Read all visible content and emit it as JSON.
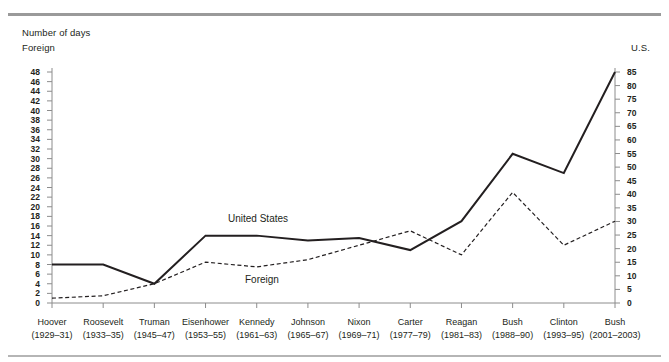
{
  "rules": {
    "top": "#9a9a9a",
    "bottom": "#b5b5b5"
  },
  "header": {
    "number_of_days": "Number of days",
    "left_axis_name": "Foreign",
    "right_axis_name": "U.S."
  },
  "chart_data": {
    "type": "line",
    "title": "Number of days",
    "xlabel": "",
    "ylabel": "Foreign",
    "y2label": "U.S.",
    "grid": false,
    "legend": "inline-annotations",
    "ylim": [
      0,
      48
    ],
    "y2lim": [
      0,
      85
    ],
    "yticks": [
      0,
      2,
      4,
      6,
      8,
      10,
      12,
      14,
      16,
      18,
      20,
      22,
      24,
      26,
      28,
      30,
      32,
      34,
      36,
      38,
      40,
      42,
      44,
      46,
      48
    ],
    "y2ticks": [
      0,
      5,
      10,
      15,
      20,
      25,
      30,
      35,
      40,
      45,
      50,
      55,
      60,
      65,
      70,
      75,
      80,
      85
    ],
    "categories": [
      "Hoover",
      "Roosevelt",
      "Truman",
      "Eisenhower",
      "Kennedy",
      "Johnson",
      "Nixon",
      "Carter",
      "Reagan",
      "Bush",
      "Clinton",
      "Bush"
    ],
    "category_years": [
      "(1929–31)",
      "(1933–35)",
      "(1945–47)",
      "(1953–55)",
      "(1961–63)",
      "(1965–67)",
      "(1969–71)",
      "(1977–79)",
      "(1981–83)",
      "(1988–90)",
      "(1993–95)",
      "(2001–2003)"
    ],
    "series": [
      {
        "name": "United States",
        "axis": "left",
        "style": "solid",
        "color": "#231f20",
        "values": [
          8,
          8,
          4,
          14,
          14,
          13,
          13.5,
          11,
          17,
          31,
          27,
          48
        ]
      },
      {
        "name": "Foreign",
        "axis": "left",
        "style": "dashed",
        "color": "#231f20",
        "values": [
          1,
          1.5,
          4,
          8.5,
          7.5,
          9,
          12,
          15,
          10,
          23,
          12,
          17
        ]
      }
    ],
    "annotations": [
      {
        "text": "United States",
        "x": 228,
        "y": 219
      },
      {
        "text": "Foreign",
        "x": 245,
        "y": 280
      }
    ]
  }
}
